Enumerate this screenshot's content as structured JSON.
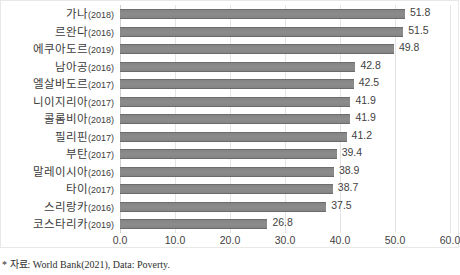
{
  "chart_data": {
    "type": "bar",
    "orientation": "horizontal",
    "title": "",
    "xlabel": "",
    "ylabel": "",
    "xlim": [
      0.0,
      60.0
    ],
    "xticks": [
      "0.0",
      "10.0",
      "20.0",
      "30.0",
      "40.0",
      "50.0",
      "60.0"
    ],
    "grid": true,
    "legend": "none",
    "bar_color": "#848484",
    "categories": [
      "가나(2018)",
      "르완다(2016)",
      "에쿠아도르(2019)",
      "남아공(2016)",
      "엘살바도르(2017)",
      "니이지리아(2017)",
      "콜롬비아(2018)",
      "필리핀(2017)",
      "부탄(2017)",
      "말레이시아(2016)",
      "타이(2017)",
      "스리랑카(2016)",
      "코스타리카(2019)"
    ],
    "country_names": [
      "가나",
      "르완다",
      "에쿠아도르",
      "남아공",
      "엘살바도르",
      "니이지리아",
      "콜롬비아",
      "필리핀",
      "부탄",
      "말레이시아",
      "타이",
      "스리랑카",
      "코스타리카"
    ],
    "years": [
      "(2018)",
      "(2016)",
      "(2019)",
      "(2016)",
      "(2017)",
      "(2017)",
      "(2018)",
      "(2017)",
      "(2017)",
      "(2016)",
      "(2017)",
      "(2016)",
      "(2019)"
    ],
    "values": [
      51.8,
      51.5,
      49.8,
      42.8,
      42.5,
      41.9,
      41.9,
      41.2,
      39.4,
      38.9,
      38.7,
      37.5,
      26.8
    ],
    "value_labels": [
      "51.8",
      "51.5",
      "49.8",
      "42.8",
      "42.5",
      "41.9",
      "41.9",
      "41.2",
      "39.4",
      "38.9",
      "38.7",
      "37.5",
      "26.8"
    ]
  },
  "footnote": {
    "text": "* 자료: World Bank(2021), Data: Poverty."
  }
}
